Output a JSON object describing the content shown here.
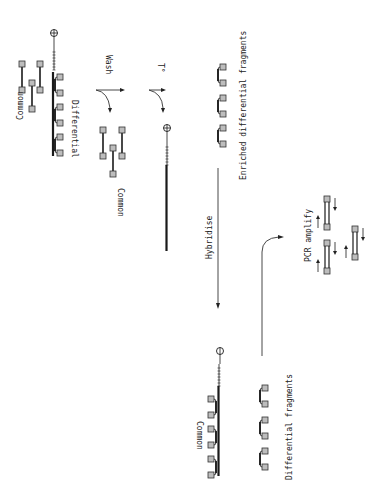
{
  "diagram": {
    "orientation": "rotated 90 degrees clockwise",
    "labels": {
      "common_top": "Common",
      "differential_top": "Differential",
      "wash": "Wash",
      "common_washed": "Common",
      "temperature": "T°",
      "enriched": "Enriched differential fragments",
      "hybridise": "Hybridise",
      "pcr_amplify": "PCR amplify",
      "common_bottom": "Common",
      "differential_fragments": "Differential fragments"
    },
    "beads": {
      "top_start": "⊕",
      "after_heat": "⊕",
      "bottom": "⊖"
    },
    "colors": {
      "ink": "#1a1a1a",
      "fragment_end": "#bdbdbd",
      "background": "#ffffff"
    }
  }
}
